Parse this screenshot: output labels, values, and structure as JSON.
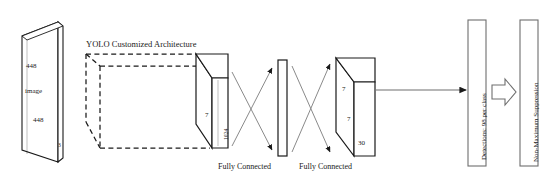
{
  "figure": {
    "domain": "diagram",
    "kind": "neural-network-architecture",
    "background": "#ffffff",
    "stroke": "#1a1a1a"
  },
  "title": {
    "text": "YOLO Customized Architecture"
  },
  "input_block": {
    "name": "input-image-cube",
    "label_center": "image",
    "label_height": "448",
    "label_width": "448",
    "label_depth": "3"
  },
  "dashed_block": {
    "name": "conv-backbone-dashed-frustum",
    "style": "dashed"
  },
  "conv_block": {
    "name": "conv-feature-cube",
    "label_side": "7",
    "label_depth": "1024"
  },
  "fc_bar": {
    "name": "fully-connected-bar"
  },
  "output_block": {
    "name": "output-tensor-cube",
    "label_height": "7",
    "label_width": "7",
    "label_depth": "30"
  },
  "fc_labels": [
    {
      "text": "Fully Connected"
    },
    {
      "text": "Fully Connected"
    }
  ],
  "stages": [
    {
      "name": "detections-box",
      "text": "Detections: 98 per class"
    },
    {
      "name": "nms-box",
      "text": "Non-Maximum Suppression"
    }
  ],
  "connectors": {
    "arrow_to_detections": "line-arrow",
    "block_arrow": "hollow-block-arrow",
    "cross_arrows": "crossed-arrows"
  }
}
